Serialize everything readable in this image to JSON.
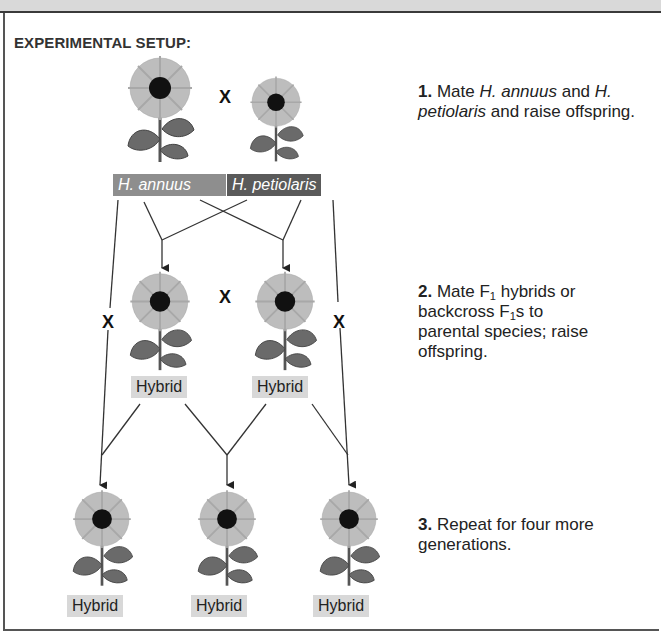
{
  "heading": "EXPERIMENTAL SETUP:",
  "cross_symbol": "X",
  "parents": [
    {
      "name": "H. annuus",
      "shade": "#8e8e8e"
    },
    {
      "name": "H. petiolaris",
      "shade": "#5a5a5a"
    }
  ],
  "hybrid_label": "Hybrid",
  "steps": [
    {
      "number": "1.",
      "parts": [
        "Mate ",
        "H. annuus",
        " and ",
        "H. petiolaris",
        " and raise offspring."
      ]
    },
    {
      "number": "2.",
      "parts": [
        "Mate F",
        "1",
        " hybrids or backcross F",
        "1",
        "s to parental species; raise offspring."
      ]
    },
    {
      "number": "3.",
      "parts": [
        "Repeat for four more generations."
      ]
    }
  ],
  "generations": {
    "parental": [
      "H. annuus",
      "H. petiolaris"
    ],
    "f1": [
      "Hybrid",
      "Hybrid"
    ],
    "later": [
      "Hybrid",
      "Hybrid",
      "Hybrid"
    ]
  }
}
